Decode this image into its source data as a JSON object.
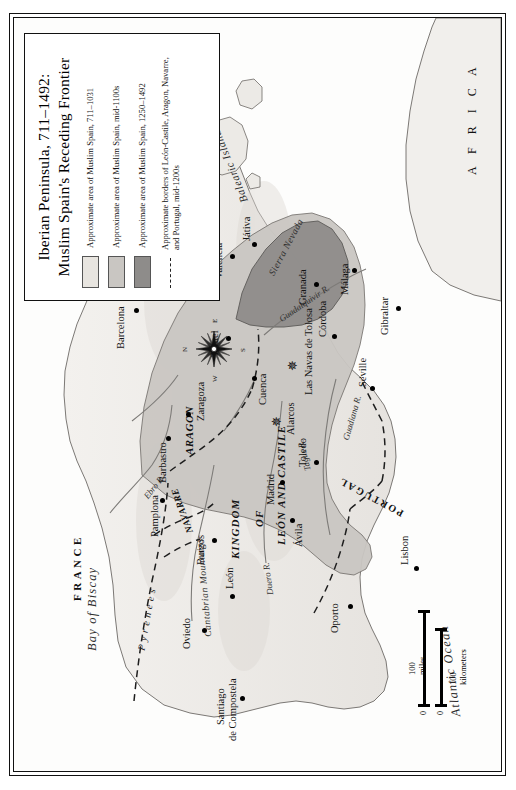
{
  "title": {
    "line1": "Iberian Peninsula, 711–1492:",
    "line2": "Muslim Spain's Receding Frontier"
  },
  "legend": {
    "items": [
      {
        "symbol": "swatch-light",
        "color": "#e8e5e0",
        "label": "Approximate area of Muslim Spain, 711–1031"
      },
      {
        "symbol": "swatch-medium",
        "color": "#c9c6c2",
        "label": "Approximate area of Muslim Spain, mid-1100s"
      },
      {
        "symbol": "swatch-dark",
        "color": "#8e8c8a",
        "label": "Approximate area of Muslim Spain, 1250–1492"
      },
      {
        "symbol": "dashed-line",
        "color": "#222222",
        "label": "Approximate borders of León-Castile, Aragon, Navarre, and Portugal, mid-1200s"
      }
    ]
  },
  "scale": {
    "zero": "0",
    "miles": "100 miles",
    "kilometers": "100 kilometers"
  },
  "compass": {
    "n": "N",
    "e": "E",
    "s": "S",
    "w": "W"
  },
  "water_labels": [
    {
      "name": "atlantic-ocean",
      "text": "Atlantic Ocean"
    },
    {
      "name": "bay-of-biscay",
      "text": "Bay of Biscay"
    },
    {
      "name": "mediterranean-sea",
      "text": "Mediterranean Sea"
    }
  ],
  "countries": [
    {
      "name": "france",
      "text": "FRANCE"
    },
    {
      "name": "africa",
      "text": "A F R I C A"
    },
    {
      "name": "portugal",
      "text": "PORTUGAL"
    },
    {
      "name": "navarre",
      "text": "NAVARRE"
    },
    {
      "name": "aragon",
      "text": "ARAGON"
    }
  ],
  "kingdom": {
    "line1": "KINGDOM",
    "line2": "OF",
    "line3": "LEÓN AND CASTILE"
  },
  "ranges": [
    {
      "name": "pyrenees",
      "text": "P y r e n e e s"
    },
    {
      "name": "cantabrian-mountains",
      "text": "Cantabrian Mountains"
    },
    {
      "name": "sierra-nevada",
      "text": "Sierra Nevada"
    },
    {
      "name": "balearic-islands",
      "text": "Balearic Islands"
    }
  ],
  "rivers": [
    {
      "name": "ebro-river",
      "text": "Ebro R."
    },
    {
      "name": "duero-river",
      "text": "Duero R."
    },
    {
      "name": "tagus-river",
      "text": "Tagus R."
    },
    {
      "name": "guadiana-river",
      "text": "Guadiana R."
    },
    {
      "name": "guadalquivir-river",
      "text": "Guadalquivir R."
    }
  ],
  "cities": [
    {
      "name": "oviedo",
      "text": "Oviedo"
    },
    {
      "name": "santiago-de-compostela",
      "text": "Santiago\nde Compostela",
      "l1": "Santiago",
      "l2": "de Compostela"
    },
    {
      "name": "leon",
      "text": "León"
    },
    {
      "name": "burgos",
      "text": "Burgos"
    },
    {
      "name": "pamplona",
      "text": "Pamplona"
    },
    {
      "name": "barbastro",
      "text": "Barbastro"
    },
    {
      "name": "zaragoza",
      "text": "Zaragoza"
    },
    {
      "name": "barcelona",
      "text": "Barcelona"
    },
    {
      "name": "valencia",
      "text": "Valencia"
    },
    {
      "name": "jativa",
      "text": "Játiva"
    },
    {
      "name": "teruel",
      "text": "Teruel"
    },
    {
      "name": "cuenca",
      "text": "Cuenca"
    },
    {
      "name": "avila",
      "text": "Ávila"
    },
    {
      "name": "madrid",
      "text": "Madrid"
    },
    {
      "name": "toledo",
      "text": "Toledo"
    },
    {
      "name": "oporto",
      "text": "Oporto"
    },
    {
      "name": "lisbon",
      "text": "Lisbon"
    },
    {
      "name": "seville",
      "text": "Seville"
    },
    {
      "name": "cordoba",
      "text": "Córdoba"
    },
    {
      "name": "granada",
      "text": "Granada"
    },
    {
      "name": "malaga",
      "text": "Málaga"
    },
    {
      "name": "gibraltar",
      "text": "Gibraltar"
    }
  ],
  "battles": [
    {
      "name": "alarcos",
      "text": "Alarcos"
    },
    {
      "name": "las-navas-de-tolosa",
      "text": "Las Navas de Tolosa"
    }
  ]
}
